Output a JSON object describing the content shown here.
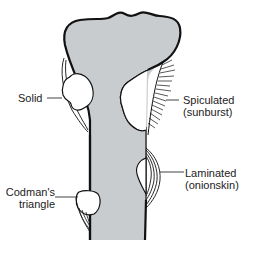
{
  "diagram": {
    "colors": {
      "bone_fill": "#c9cccf",
      "outline": "#111111",
      "lesion_fill": "#ffffff",
      "background": "#ffffff",
      "text": "#222222"
    },
    "labels": {
      "solid": "Solid",
      "spiculated_line1": "Spiculated",
      "spiculated_line2": "(sunburst)",
      "laminated_line1": "Laminated",
      "laminated_line2": "(onionskin)",
      "codman_line1": "Codman's",
      "codman_line2": "triangle"
    }
  }
}
